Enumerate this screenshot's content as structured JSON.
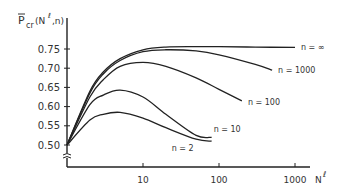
{
  "chart_data": {
    "type": "line",
    "title": "",
    "ylabel": "P̄cr(Nℓ, n)",
    "xlabel": "Nℓ",
    "xscale": "log",
    "x_ticks": [
      10,
      100,
      1000
    ],
    "x_tick_labels": [
      "10",
      "100",
      "1000"
    ],
    "y_ticks": [
      0.5,
      0.55,
      0.6,
      0.65,
      0.7,
      0.75
    ],
    "y_tick_labels": [
      "0.50",
      "0.55",
      "0.60",
      "0.65",
      "0.70",
      "0.75"
    ],
    "ylim": [
      0.47,
      0.78
    ],
    "xlim": [
      1,
      2000
    ],
    "y_axis_break": true,
    "grid": false,
    "legend": "inline labels at curve ends",
    "series": [
      {
        "name": "n = ∞",
        "x": [
          1,
          2,
          3,
          5,
          10,
          20,
          50,
          100,
          300,
          1000
        ],
        "y": [
          0.5,
          0.64,
          0.69,
          0.725,
          0.748,
          0.755,
          0.756,
          0.756,
          0.755,
          0.754
        ]
      },
      {
        "name": "n = 1000",
        "x": [
          1,
          2,
          3,
          5,
          10,
          20,
          50,
          100,
          300,
          500
        ],
        "y": [
          0.5,
          0.635,
          0.685,
          0.72,
          0.743,
          0.748,
          0.745,
          0.735,
          0.71,
          0.695
        ]
      },
      {
        "name": "n = 100",
        "x": [
          1,
          2,
          3,
          5,
          10,
          20,
          50,
          100,
          200
        ],
        "y": [
          0.5,
          0.625,
          0.67,
          0.705,
          0.715,
          0.705,
          0.675,
          0.645,
          0.615
        ]
      },
      {
        "name": "n = 10",
        "x": [
          1,
          2,
          3,
          5,
          10,
          20,
          50,
          80
        ],
        "y": [
          0.5,
          0.605,
          0.63,
          0.643,
          0.625,
          0.58,
          0.525,
          0.52
        ]
      },
      {
        "name": "n = 2",
        "x": [
          1,
          2,
          3,
          5,
          10,
          20,
          50,
          80
        ],
        "y": [
          0.5,
          0.565,
          0.58,
          0.585,
          0.57,
          0.545,
          0.515,
          0.51
        ]
      }
    ]
  },
  "labels": {
    "ylabel_main": "P",
    "ylabel_sub": "cr",
    "ylabel_args": "(N",
    "ylabel_sup": "ℓ",
    "ylabel_tail": ",n)",
    "xlabel_main": "N",
    "xlabel_sup": "ℓ",
    "series_labels": [
      "n = ∞",
      "n = 1000",
      "n = 100",
      "n = 10",
      "n = 2"
    ]
  }
}
